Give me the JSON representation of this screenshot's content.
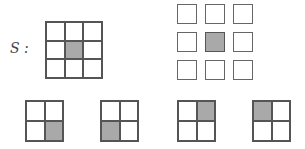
{
  "label": "S :",
  "fill_color": "#a9a9a9",
  "main_grid": {
    "rows": 3,
    "cols": 3,
    "shaded": [
      [
        1,
        1
      ]
    ]
  },
  "separated_grid": {
    "rows": 3,
    "cols": 3,
    "shaded": [
      [
        1,
        1
      ]
    ]
  },
  "small_grids": [
    {
      "shaded": [
        1,
        1
      ]
    },
    {
      "shaded": [
        1,
        0
      ]
    },
    {
      "shaded": [
        0,
        1
      ]
    },
    {
      "shaded": [
        0,
        0
      ]
    }
  ]
}
